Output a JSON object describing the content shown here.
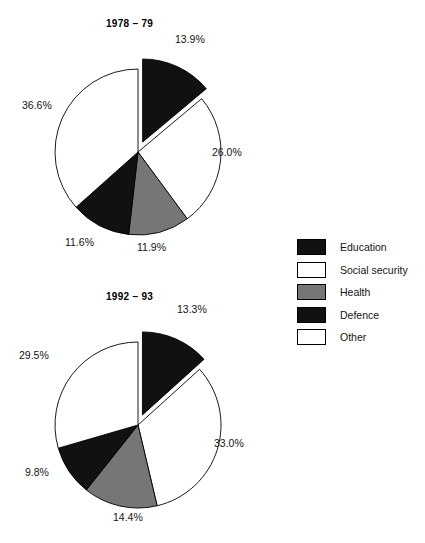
{
  "figure": {
    "background_color": "#ffffff",
    "width": 425,
    "height": 543
  },
  "palette": {
    "education": "#111111",
    "social_security": "#ffffff",
    "health": "#767676",
    "defence": "#111111",
    "other": "#ffffff",
    "outline": "#000000",
    "text": "#141414"
  },
  "legend": {
    "position": "right",
    "items": [
      {
        "label": "Education",
        "color": "#111111",
        "swatch": "filled-black-swatch"
      },
      {
        "label": "Social security",
        "color": "#ffffff",
        "swatch": "outlined-white-swatch"
      },
      {
        "label": "Health",
        "color": "#767676",
        "swatch": "filled-gray-swatch"
      },
      {
        "label": "Defence",
        "color": "#111111",
        "swatch": "filled-black-swatch"
      },
      {
        "label": "Other",
        "color": "#ffffff",
        "swatch": "outlined-white-swatch"
      }
    ]
  },
  "chart_data": [
    {
      "type": "pie",
      "title": "1978 – 79",
      "categories": [
        "Education",
        "Social security",
        "Health",
        "Defence",
        "Other"
      ],
      "values": [
        13.9,
        26.0,
        11.9,
        11.6,
        36.6
      ],
      "labels": [
        "13.9%",
        "26.0%",
        "11.9%",
        "11.6%",
        "36.6%"
      ],
      "colors": [
        "#111111",
        "#ffffff",
        "#767676",
        "#111111",
        "#ffffff"
      ],
      "exploded": [
        "Education"
      ],
      "start_angle_deg": 0,
      "direction": "clockwise",
      "xlabel": "",
      "ylabel": ""
    },
    {
      "type": "pie",
      "title": "1992 – 93",
      "categories": [
        "Education",
        "Social security",
        "Health",
        "Defence",
        "Other"
      ],
      "values": [
        13.3,
        33.0,
        14.4,
        9.8,
        29.5
      ],
      "labels": [
        "13.3%",
        "33.0%",
        "14.4%",
        "9.8%",
        "29.5%"
      ],
      "colors": [
        "#111111",
        "#ffffff",
        "#767676",
        "#111111",
        "#ffffff"
      ],
      "exploded": [
        "Education"
      ],
      "start_angle_deg": 0,
      "direction": "clockwise",
      "xlabel": "",
      "ylabel": ""
    }
  ]
}
